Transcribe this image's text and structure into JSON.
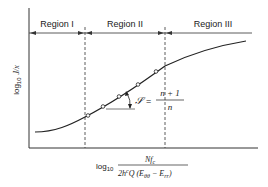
{
  "regions": [
    {
      "label": "Region I"
    },
    {
      "label": "Region II"
    },
    {
      "label": "Region III"
    }
  ],
  "axes": {
    "y_label_prefix": "log",
    "y_label_sub": "10",
    "y_label_var": "J/x",
    "x_label_prefix": "log",
    "x_label_sub": "10",
    "x_numerator": "Nf",
    "x_numerator_sub": "c",
    "x_denominator_a": "2h",
    "x_denominator_sup": "c",
    "x_denominator_b": "Q (E",
    "x_denominator_sub1": "θθ",
    "x_denominator_c": " − E",
    "x_denominator_sub2": "rr",
    "x_denominator_d": ")"
  },
  "slope": {
    "symbol": "𝒮",
    "equals": "=",
    "numerator": "n + 1",
    "denominator": "n"
  },
  "colors": {
    "ink": "#222222",
    "background": "#ffffff"
  }
}
